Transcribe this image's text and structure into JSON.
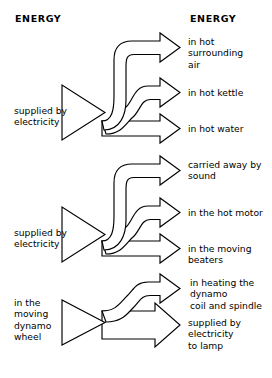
{
  "diagram": {
    "headings": {
      "left": "ENERGY",
      "right": "ENERGY"
    },
    "colors": {
      "background": "#ffffff",
      "stroke": "#000000",
      "fill": "#ffffff",
      "text": "#000000"
    },
    "groups": [
      {
        "id": "kettle",
        "input_label": "supplied by\nelectricity",
        "outputs": [
          {
            "id": "hot-surrounding-air",
            "label": "in hot\nsurrounding\nair"
          },
          {
            "id": "hot-kettle",
            "label": "in hot kettle"
          },
          {
            "id": "hot-water",
            "label": "in hot water"
          }
        ]
      },
      {
        "id": "mixer",
        "input_label": "supplied by\nelectricity",
        "outputs": [
          {
            "id": "carried-away-by-sound",
            "label": "carried away by\nsound"
          },
          {
            "id": "hot-motor",
            "label": "in the hot motor"
          },
          {
            "id": "moving-beaters",
            "label": "in the moving\nbeaters"
          }
        ]
      },
      {
        "id": "dynamo",
        "input_label": "in the\nmoving\ndynamo\nwheel",
        "outputs": [
          {
            "id": "heating-dynamo-coil-spindle",
            "label": "in heating the\ndynamo\ncoil and spindle"
          },
          {
            "id": "supplied-to-lamp",
            "label": "supplied by\nelectricity\nto lamp"
          }
        ]
      }
    ]
  }
}
